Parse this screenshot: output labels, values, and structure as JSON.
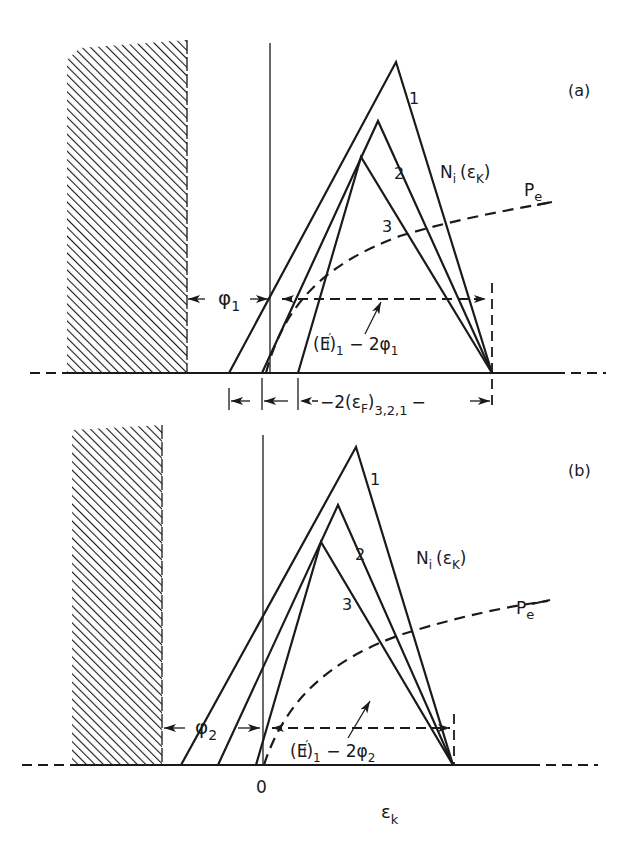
{
  "figure": {
    "panels": [
      {
        "id": "a",
        "panel_label": "(a)",
        "curve_label": "Ni (εK)",
        "curve_label_main": "N",
        "curve_label_sub": "i",
        "curve_label_arg": "(ε",
        "curve_label_arg_sub": "K",
        "curve_label_close": ")",
        "peak_labels": [
          "1",
          "2",
          "3"
        ],
        "pe_label_main": "P",
        "pe_label_sub": "e",
        "phi_label_main": "φ",
        "phi_label_sub": "1",
        "energy_label_pre": "(E",
        "energy_label_prime": "′",
        "energy_label_sub_i": "i",
        "energy_label_close": ")",
        "energy_label_sub1": "1",
        "energy_label_rest": " − 2φ",
        "energy_label_phi_sub": "1",
        "fermi_label_pre": "−2(ε",
        "fermi_label_sub_f": "F",
        "fermi_label_close": ")",
        "fermi_label_sub": "3,2,1",
        "fermi_label_post": "−"
      },
      {
        "id": "b",
        "panel_label": "(b)",
        "curve_label_main": "N",
        "curve_label_sub": "i",
        "curve_label_arg": "(ε",
        "curve_label_arg_sub": "K",
        "curve_label_close": ")",
        "peak_labels": [
          "1",
          "2",
          "3"
        ],
        "pe_label_main": "P",
        "pe_label_sub": "e",
        "phi_label_main": "φ",
        "phi_label_sub": "2",
        "energy_label_pre": "(E",
        "energy_label_prime": "′",
        "energy_label_sub_i": "i",
        "energy_label_close": ")",
        "energy_label_sub1": "1",
        "energy_label_rest": " − 2φ",
        "energy_label_phi_sub": "2",
        "origin_label": "0",
        "axis_label_main": "ε",
        "axis_label_sub": "k"
      }
    ]
  }
}
